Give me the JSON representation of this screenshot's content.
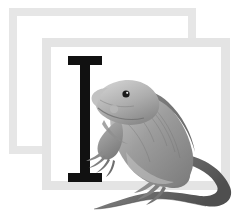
{
  "canvas": {
    "width": 238,
    "height": 211,
    "background_color": "#ffffff",
    "description": "Grayscale educational flashcard illustration: two overlapping blank picture frames with a serif capital letter I and an iguana"
  },
  "frames": {
    "back": {
      "name": "back-picture-frame",
      "border_color": "#e6e6e6",
      "fill_color": "#ffffff",
      "border_width_px": 8,
      "x": 9,
      "y": 8,
      "width": 187,
      "height": 146
    },
    "front": {
      "name": "front-picture-frame",
      "border_color": "#e4e4e4",
      "fill_color": "#ffffff",
      "border_width_px": 9,
      "x": 42,
      "y": 38,
      "width": 188,
      "height": 152
    }
  },
  "letter": {
    "character": "I",
    "case": "uppercase",
    "style": "serif-slab",
    "color": "#111111",
    "x": 68,
    "y": 56,
    "width": 34,
    "height": 126
  },
  "subject": {
    "name": "iguana",
    "type": "reptile-illustration",
    "rendering": "grayscale-pencil-shading",
    "primary_color": "#9a9a9a",
    "shadow_color": "#6e6e6e",
    "highlight_color": "#cfcfcf",
    "outline_color": "#5a5a5a",
    "eye_color": "#1b1b1b",
    "pose": "standing-profile-facing-left",
    "x": 84,
    "y": 76,
    "width": 152,
    "height": 135,
    "notes": "tail curves right then sweeps down-left, extending past the bottom edge of the front frame"
  },
  "alt_text": "Letter I is for Iguana"
}
